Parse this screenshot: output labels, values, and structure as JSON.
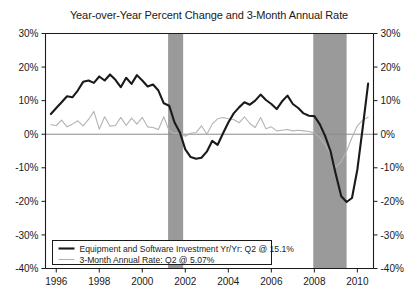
{
  "chart_data": {
    "type": "line",
    "title": "Year-over-Year Percent Change and 3-Month Annual Rate",
    "xlabel": "",
    "ylabel": "",
    "xlim": [
      1995.5,
      2010.75
    ],
    "ylim": [
      -40,
      30
    ],
    "ytick_values": [
      30,
      20,
      10,
      0,
      -10,
      -20,
      -30,
      -40
    ],
    "ytick_labels": [
      "30%",
      "20%",
      "10%",
      "0%",
      "-10%",
      "-20%",
      "-30%",
      "-40%"
    ],
    "ytick_labels_right": [
      "30%",
      "20%",
      "10%",
      "0%",
      "-10%",
      "-20%",
      "-30%",
      "-40%"
    ],
    "xtick_values": [
      1996,
      1998,
      2000,
      2002,
      2004,
      2006,
      2008,
      2010
    ],
    "xtick_labels": [
      "1996",
      "1998",
      "2000",
      "2002",
      "2004",
      "2006",
      "2008",
      "2010"
    ],
    "grid": false,
    "zero_line": true,
    "legend_position": "bottom-left",
    "recession_bands": [
      {
        "start": 2001.2,
        "end": 2001.9
      },
      {
        "start": 2007.95,
        "end": 2009.5
      }
    ],
    "recession_band_color": "#9a9a9a",
    "series": [
      {
        "name": "Equipment and Software Investment Yr/Yr: Q2 @ 15.1%",
        "color": "#1a1a1a",
        "width": 2.1,
        "latest_label": "Q2 @ 15.1%",
        "latest_value": 15.1,
        "x": [
          1995.75,
          1996.0,
          1996.25,
          1996.5,
          1996.75,
          1997.0,
          1997.25,
          1997.5,
          1997.75,
          1998.0,
          1998.25,
          1998.5,
          1998.75,
          1999.0,
          1999.25,
          1999.5,
          1999.75,
          2000.0,
          2000.25,
          2000.5,
          2000.75,
          2001.0,
          2001.25,
          2001.5,
          2001.75,
          2002.0,
          2002.25,
          2002.5,
          2002.75,
          2003.0,
          2003.25,
          2003.5,
          2003.75,
          2004.0,
          2004.25,
          2004.5,
          2004.75,
          2005.0,
          2005.25,
          2005.5,
          2005.75,
          2006.0,
          2006.25,
          2006.5,
          2006.75,
          2007.0,
          2007.25,
          2007.5,
          2007.75,
          2008.0,
          2008.25,
          2008.5,
          2008.75,
          2009.0,
          2009.25,
          2009.5,
          2009.75,
          2010.0,
          2010.25,
          2010.5
        ],
        "values": [
          6.0,
          7.8,
          9.5,
          11.3,
          11.0,
          13.0,
          15.6,
          16.0,
          15.3,
          17.2,
          16.0,
          17.8,
          16.2,
          14.0,
          16.8,
          15.0,
          17.6,
          16.0,
          14.2,
          14.8,
          13.0,
          9.2,
          8.5,
          3.5,
          0.5,
          -4.5,
          -6.8,
          -7.3,
          -7.0,
          -5.2,
          -2.0,
          -3.2,
          0.2,
          3.5,
          6.2,
          8.0,
          9.5,
          8.8,
          10.0,
          11.8,
          10.2,
          9.0,
          7.5,
          9.8,
          11.5,
          9.0,
          7.8,
          6.2,
          5.5,
          5.4,
          3.0,
          -0.5,
          -5.0,
          -12.0,
          -18.5,
          -20.2,
          -19.0,
          -10.5,
          2.0,
          15.1
        ]
      },
      {
        "name": "3-Month Annual Rate: Q2 @ 5.07%",
        "color": "#b3b3b3",
        "width": 1.1,
        "latest_label": "Q2 @ 5.07%",
        "latest_value": 5.07,
        "x": [
          1995.75,
          1996.0,
          1996.25,
          1996.5,
          1996.75,
          1997.0,
          1997.25,
          1997.5,
          1997.75,
          1998.0,
          1998.25,
          1998.5,
          1998.75,
          1999.0,
          1999.25,
          1999.5,
          1999.75,
          2000.0,
          2000.25,
          2000.5,
          2000.75,
          2001.0,
          2001.25,
          2001.5,
          2001.75,
          2002.0,
          2002.25,
          2002.5,
          2002.75,
          2003.0,
          2003.25,
          2003.5,
          2003.75,
          2004.0,
          2004.25,
          2004.5,
          2004.75,
          2005.0,
          2005.25,
          2005.5,
          2005.75,
          2006.0,
          2006.25,
          2006.5,
          2006.75,
          2007.0,
          2007.25,
          2007.5,
          2007.75,
          2008.0,
          2008.25,
          2008.5,
          2008.75,
          2009.0,
          2009.25,
          2009.5,
          2009.75,
          2010.0,
          2010.25,
          2010.5
        ],
        "values": [
          2.8,
          2.6,
          4.2,
          2.2,
          3.0,
          4.0,
          2.5,
          4.4,
          6.8,
          1.5,
          5.2,
          2.4,
          2.6,
          5.0,
          2.6,
          4.8,
          3.0,
          5.0,
          2.2,
          2.0,
          1.4,
          5.2,
          1.0,
          0.2,
          0.4,
          -0.6,
          0.3,
          0.5,
          2.5,
          0.0,
          3.0,
          4.6,
          5.0,
          4.6,
          4.4,
          3.4,
          5.2,
          3.2,
          2.0,
          5.0,
          1.6,
          2.2,
          1.0,
          1.2,
          1.4,
          1.0,
          1.2,
          1.0,
          0.8,
          0.4,
          -1.0,
          -3.0,
          -6.0,
          -9.8,
          -8.2,
          -5.0,
          -1.0,
          2.5,
          4.2,
          5.07
        ]
      }
    ]
  },
  "legend": {
    "entries": [
      {
        "label": "Equipment and Software Investment Yr/Yr: Q2 @ 15.1%",
        "color": "#1a1a1a"
      },
      {
        "label": "3-Month Annual Rate: Q2 @ 5.07%",
        "color": "#b3b3b3"
      }
    ]
  }
}
